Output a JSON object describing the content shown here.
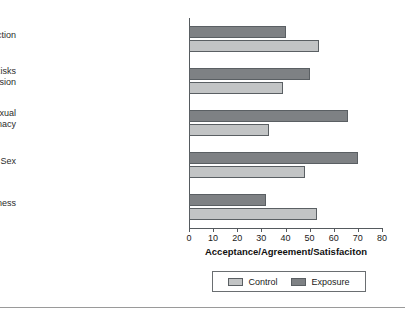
{
  "figure": {
    "top_clipped_text": "",
    "background_color": "#ffffff",
    "rule_color": "#9a9a9a"
  },
  "chart_data": {
    "type": "bar",
    "orientation": "horizontal",
    "title": "",
    "xlabel": "Acceptance/Agreement/Satisfaciton",
    "ylabel": "",
    "xlim": [
      0,
      80
    ],
    "xticks": [
      0,
      10,
      20,
      30,
      40,
      50,
      60,
      70,
      80
    ],
    "xtick_labels": [
      "0",
      "10",
      "20",
      "30",
      "40",
      "50",
      "60",
      "70",
      "80"
    ],
    "grid": false,
    "legend_position": "bottom",
    "categories": [
      "Sexual Satisfaction",
      "Acceptance of Myth of Health Risks from Sexual Repression",
      "Acceptance of Nonexclusive Sexual Intimacy",
      "Acceptance of Premarital Sex",
      "Importance of Faithfulness"
    ],
    "category_lines": [
      [
        "Sexual Satisfaction"
      ],
      [
        "Acceptance of Myth of Health Risks",
        "from Sexual Repression"
      ],
      [
        "Acceptance of Nonexclusive Sexual",
        "Intimacy"
      ],
      [
        "Acceptance of Premarital Sex"
      ],
      [
        "Importance of Faithfulness"
      ]
    ],
    "series": [
      {
        "name": "Control",
        "color": "#c2c4c5",
        "values": [
          54,
          39,
          33,
          48,
          53
        ]
      },
      {
        "name": "Exposure",
        "color": "#7e8184",
        "values": [
          40,
          50,
          66,
          70,
          32
        ]
      }
    ]
  },
  "legend": {
    "entries": [
      {
        "label": "Control",
        "color": "#c2c4c5"
      },
      {
        "label": "Exposure",
        "color": "#7e8184"
      }
    ]
  }
}
